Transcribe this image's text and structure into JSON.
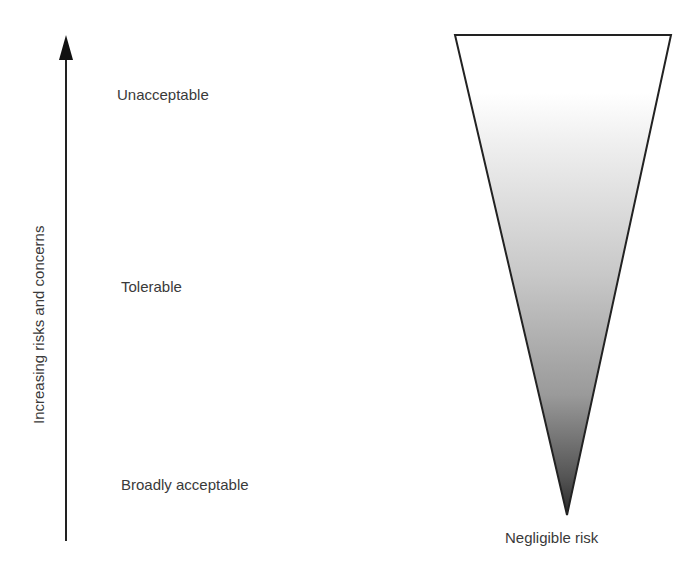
{
  "axis": {
    "label": "Increasing risks and concerns",
    "direction": "up"
  },
  "levels": [
    {
      "label": "Unacceptable"
    },
    {
      "label": "Tolerable"
    },
    {
      "label": "Broadly acceptable"
    }
  ],
  "triangle": {
    "apex_label": "Negligible risk",
    "gradient_top": "#ffffff",
    "gradient_bottom": "#3a3a3a",
    "stroke": "#222222"
  }
}
